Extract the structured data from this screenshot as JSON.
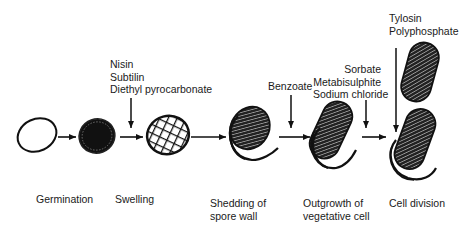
{
  "diagram": {
    "type": "process-flow",
    "stages": [
      {
        "id": "spore",
        "label": ""
      },
      {
        "id": "germination",
        "label": "Germination"
      },
      {
        "id": "swelling",
        "label": "Swelling"
      },
      {
        "id": "shedding",
        "label_lines": [
          "Shedding of",
          "spore wall"
        ]
      },
      {
        "id": "outgrowth",
        "label_lines": [
          "Outgrowth of",
          "vegetative cell"
        ]
      },
      {
        "id": "division",
        "label": "Cell division"
      }
    ],
    "inhibitors": [
      {
        "target": "germination-to-swelling",
        "lines": [
          "Nisin",
          "Subtilin",
          "Diethyl pyrocarbonate"
        ]
      },
      {
        "target": "shedding-to-outgrowth",
        "lines": [
          "Benzoate"
        ]
      },
      {
        "target": "outgrowth-to-division",
        "lines": [
          "Sorbate",
          "Metabisulphite",
          "Sodium chloride"
        ]
      },
      {
        "target": "cell-division",
        "lines": [
          "Tylosin",
          "Polyphosphate"
        ]
      }
    ]
  }
}
